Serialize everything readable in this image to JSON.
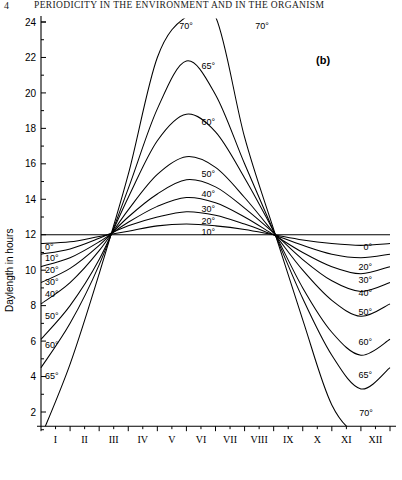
{
  "running_head": {
    "folio": "4",
    "title": "PERIODICITY IN THE ENVIRONMENT AND IN THE ORGANISM"
  },
  "panel": {
    "label": "(b)"
  },
  "chart_data": {
    "type": "line",
    "title": "",
    "subtitle": "",
    "xlabel": "",
    "ylabel": "Daylength in hours",
    "xlim": [
      0,
      12
    ],
    "ylim": [
      0,
      24
    ],
    "ytick_values": [
      2,
      4,
      6,
      8,
      10,
      12,
      14,
      16,
      18,
      20,
      22,
      24
    ],
    "ytick_labels": [
      "2",
      "4",
      "6",
      "8",
      "10",
      "12",
      "14",
      "16",
      "18",
      "20",
      "22",
      "24"
    ],
    "y_minor_step": 1,
    "xtick_values": [
      1,
      2,
      3,
      4,
      5,
      6,
      7,
      8,
      9,
      10,
      11,
      12
    ],
    "xtick_labels": [
      "I",
      "II",
      "III",
      "IV",
      "V",
      "VI",
      "VII",
      "VIII",
      "IX",
      "X",
      "XI",
      "XII"
    ],
    "x_minor": true,
    "grid": false,
    "legend_position": "inline-curve-labels",
    "axis_note": "x axis = months of the year (Roman numerals); y axis = daylength in hours",
    "series": [
      {
        "name": "0°",
        "latitude_deg": 0,
        "left_label": "0°",
        "peak_label": null,
        "right_label": "0°",
        "top_label": null,
        "values": [
          12.0,
          12.0,
          12.0,
          12.0,
          12.0,
          12.0,
          12.0,
          12.0,
          12.0,
          12.0,
          12.0,
          12.0,
          12.0
        ]
      },
      {
        "name": "10°",
        "latitude_deg": 10,
        "left_label": "10°",
        "peak_label": "10°",
        "right_label": null,
        "top_label": null,
        "values": [
          11.5,
          11.6,
          11.9,
          12.2,
          12.5,
          12.6,
          12.5,
          12.3,
          12.0,
          11.7,
          11.5,
          11.4,
          11.5
        ]
      },
      {
        "name": "20°",
        "latitude_deg": 20,
        "left_label": "20°",
        "peak_label": "20°",
        "right_label": "20°",
        "top_label": null,
        "values": [
          10.9,
          11.2,
          11.8,
          12.5,
          13.0,
          13.3,
          13.1,
          12.6,
          12.0,
          11.4,
          10.9,
          10.7,
          10.9
        ]
      },
      {
        "name": "30°",
        "latitude_deg": 30,
        "left_label": "30°",
        "peak_label": "30°",
        "right_label": "30°",
        "top_label": null,
        "values": [
          10.2,
          10.7,
          11.6,
          12.7,
          13.6,
          14.1,
          13.8,
          13.0,
          12.0,
          11.0,
          10.2,
          9.8,
          10.2
        ]
      },
      {
        "name": "40°",
        "latitude_deg": 40,
        "left_label": "40°",
        "peak_label": "40°",
        "right_label": "40°",
        "top_label": null,
        "values": [
          9.3,
          10.1,
          11.4,
          13.0,
          14.3,
          15.1,
          14.7,
          13.5,
          12.1,
          10.6,
          9.4,
          8.8,
          9.3
        ]
      },
      {
        "name": "50°",
        "latitude_deg": 50,
        "left_label": "50°",
        "peak_label": "50°",
        "right_label": "50°",
        "top_label": null,
        "values": [
          8.1,
          9.3,
          11.1,
          13.4,
          15.4,
          16.4,
          15.8,
          14.1,
          12.1,
          10.0,
          8.3,
          7.4,
          8.1
        ]
      },
      {
        "name": "60°",
        "latitude_deg": 60,
        "left_label": "60°",
        "peak_label": "60°",
        "right_label": "60°",
        "top_label": null,
        "values": [
          6.1,
          8.0,
          10.6,
          14.1,
          17.3,
          18.8,
          17.8,
          15.2,
          12.2,
          9.0,
          6.5,
          5.2,
          6.1
        ]
      },
      {
        "name": "65°",
        "latitude_deg": 65,
        "left_label": "65°",
        "peak_label": "65°",
        "right_label": "65°",
        "top_label": null,
        "values": [
          4.5,
          7.0,
          10.3,
          14.6,
          19.1,
          21.8,
          19.9,
          16.0,
          12.2,
          8.4,
          5.2,
          3.3,
          4.5
        ]
      },
      {
        "name": "70°",
        "latitude_deg": 70,
        "left_label": null,
        "peak_label": null,
        "right_label": null,
        "top_label": "70°",
        "values": [
          0.0,
          4.7,
          9.8,
          15.4,
          22.0,
          24.0,
          24.0,
          17.5,
          12.3,
          7.2,
          2.4,
          0.0,
          0.0
        ]
      }
    ]
  }
}
